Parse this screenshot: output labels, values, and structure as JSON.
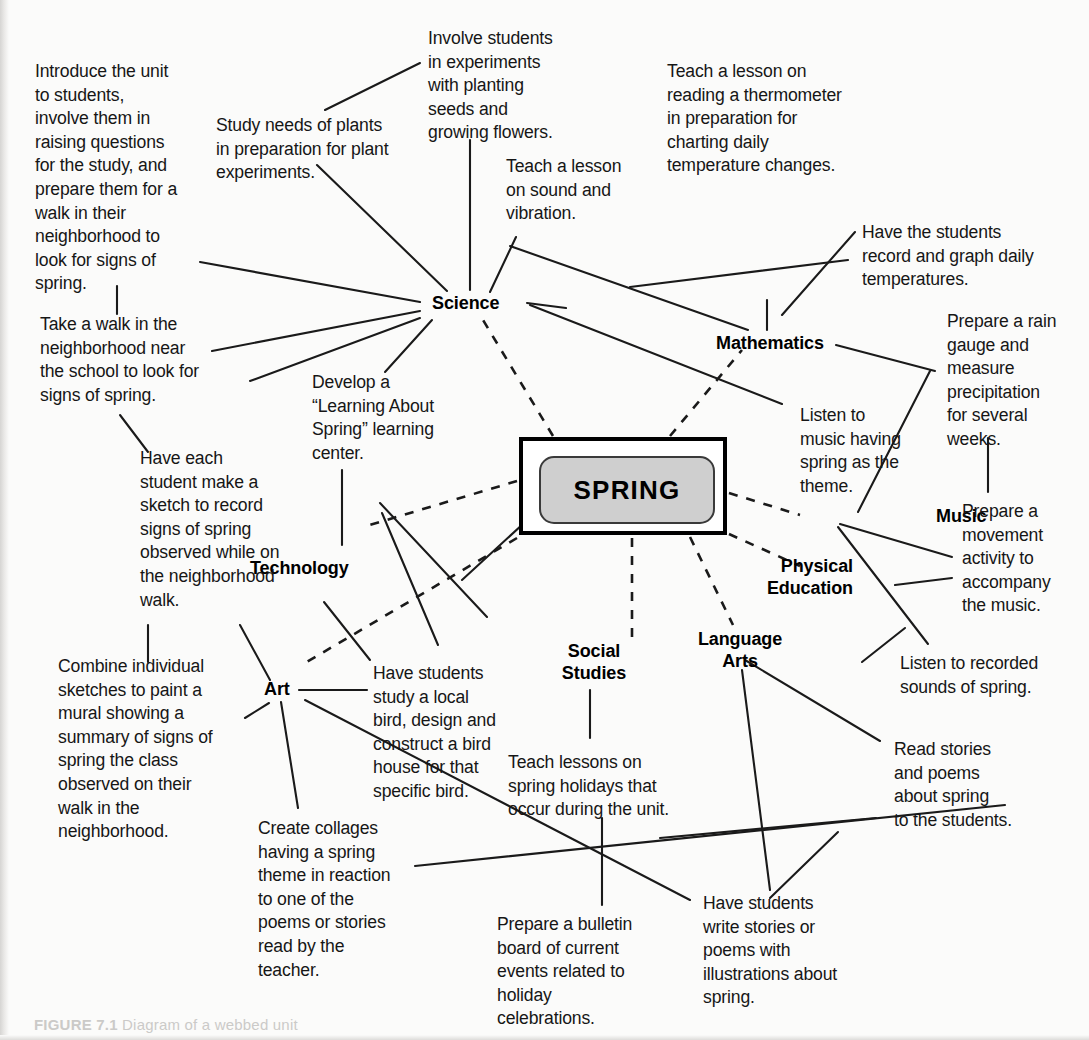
{
  "figure": {
    "center_label": "SPRING",
    "caption_prefix": "FIGURE",
    "caption_number": "7.1",
    "caption_text": "Diagram of a webbed unit"
  },
  "subjects": [
    {
      "id": "science",
      "label": "Science"
    },
    {
      "id": "mathematics",
      "label": "Mathematics"
    },
    {
      "id": "music",
      "label": "Music"
    },
    {
      "id": "physical-education",
      "label": "Physical\nEducation"
    },
    {
      "id": "language-arts",
      "label": "Language\nArts"
    },
    {
      "id": "social-studies",
      "label": "Social\nStudies"
    },
    {
      "id": "art",
      "label": "Art"
    },
    {
      "id": "technology",
      "label": "Technology"
    }
  ],
  "activities": [
    {
      "id": "introduce-unit",
      "subject": "science",
      "text": "Introduce the unit\nto students,\ninvolve them in\nraising questions\nfor the study, and\nprepare them for a\nwalk in their\nneighborhood to\nlook for signs of\nspring."
    },
    {
      "id": "take-a-walk",
      "subject": "science",
      "text": "Take a walk in the\nneighborhood near\nthe school to look for\nsigns of spring."
    },
    {
      "id": "study-needs-of-plants",
      "subject": "science",
      "text": "Study needs of plants\nin preparation for plant\nexperiments."
    },
    {
      "id": "involve-students-experiments",
      "subject": "science",
      "text": "Involve students\nin experiments\nwith planting\nseeds and\ngrowing flowers."
    },
    {
      "id": "sound-and-vibration",
      "subject": "science",
      "text": "Teach a lesson\non sound and\nvibration."
    },
    {
      "id": "reading-a-thermometer",
      "subject": "mathematics",
      "text": "Teach a lesson on\nreading a thermometer\nin preparation for\ncharting daily\ntemperature changes."
    },
    {
      "id": "record-and-graph-temperatures",
      "subject": "mathematics",
      "text": "Have the students\nrecord and graph daily\ntemperatures."
    },
    {
      "id": "rain-gauge",
      "subject": "mathematics",
      "text": "Prepare a rain\ngauge and\nmeasure\nprecipitation\nfor several\nweeks."
    },
    {
      "id": "music-spring-theme",
      "subject": "music",
      "text": "Listen to\nmusic having\nspring as the\ntheme."
    },
    {
      "id": "movement-activity",
      "subject": "physical-education",
      "text": "Prepare a\nmovement\nactivity to\naccompany\nthe music."
    },
    {
      "id": "recorded-sounds-of-spring",
      "subject": "music",
      "text": "Listen to recorded\nsounds of spring."
    },
    {
      "id": "read-stories-and-poems",
      "subject": "language-arts",
      "text": "Read stories\nand poems\nabout spring\nto the students."
    },
    {
      "id": "write-stories-or-poems",
      "subject": "language-arts",
      "text": "Have students\nwrite stories or\npoems with\nillustrations about\nspring."
    },
    {
      "id": "spring-holidays",
      "subject": "social-studies",
      "text": "Teach lessons on\nspring holidays that\noccur during the unit."
    },
    {
      "id": "bulletin-board",
      "subject": "social-studies",
      "text": "Prepare a bulletin\nboard of current\nevents related to\nholiday\ncelebrations."
    },
    {
      "id": "bird-house",
      "subject": "technology",
      "text": "Have students\nstudy a local\nbird, design and\nconstruct a bird\nhouse for that\nspecific bird."
    },
    {
      "id": "learning-center",
      "subject": "technology",
      "text": "Develop a\n“Learning About\nSpring” learning\ncenter."
    },
    {
      "id": "sketch-signs-of-spring",
      "subject": "art",
      "text": "Have each\nstudent make a\nsketch to record\nsigns of spring\nobserved while on\nthe neighborhood\nwalk."
    },
    {
      "id": "combine-sketches-mural",
      "subject": "art",
      "text": "Combine individual\nsketches to paint a\nmural showing a\nsummary of signs of\nspring the class\nobserved on their\nwalk in the\nneighborhood."
    },
    {
      "id": "create-collages",
      "subject": "art",
      "text": "Create collages\nhaving a spring\ntheme in reaction\nto one of the\npoems or stories\nread by the\nteacher."
    }
  ],
  "colors": {
    "ink": "#161616",
    "line": "#1a1a1a",
    "center_fill": "#cfcfcf",
    "page": "#fbfbfa"
  }
}
